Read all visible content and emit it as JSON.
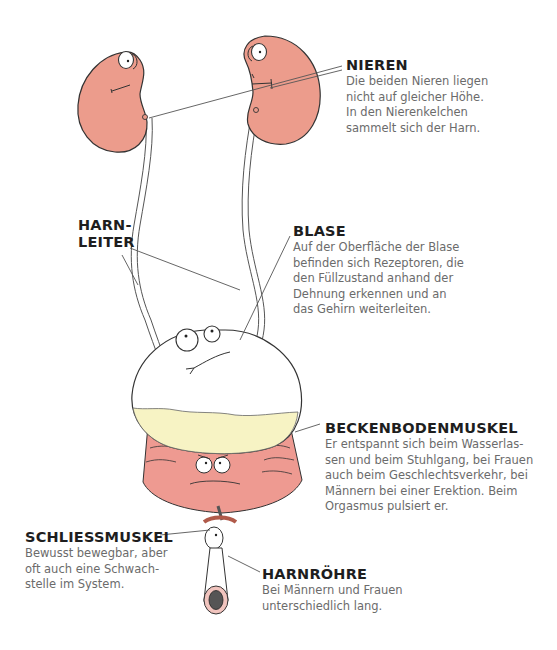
{
  "colors": {
    "kidney": "#ec9c8c",
    "bladder": "#ffffff",
    "urine": "#f7f3c4",
    "pelvic_muscle": "#ee9a91",
    "outline": "#333333",
    "title_text": "#1e1e1e",
    "body_text": "#6b6b6b"
  },
  "labels": {
    "nieren": {
      "title": "NIEREN",
      "lines": [
        "Die beiden Nieren liegen",
        "nicht auf gleicher Höhe.",
        "In den Nierenkelchen",
        "sammelt sich der Harn."
      ]
    },
    "harnleiter": {
      "title_lines": [
        "HARN-",
        "LEITER"
      ]
    },
    "blase": {
      "title": "BLASE",
      "lines": [
        "Auf der Oberfläche der Blase",
        "befinden sich Rezeptoren, die",
        "den Füllzustand anhand der",
        "Dehnung erkennen und an",
        "das Gehirn weiterleiten."
      ]
    },
    "beckenbodenmuskel": {
      "title": "BECKENBODENMUSKEL",
      "lines": [
        "Er entspannt sich beim Wasserlas-",
        "sen und beim Stuhlgang, bei Frauen",
        "auch beim Geschlechtsverkehr, bei",
        "Männern bei einer Erektion. Beim",
        "Orgasmus pulsiert er."
      ]
    },
    "schliessmuskel": {
      "title": "SCHLIESSMUSKEL",
      "lines": [
        "Bewusst bewegbar, aber",
        "oft auch eine Schwach-",
        "stelle im System."
      ]
    },
    "harnroehre": {
      "title": "HARNRÖHRE",
      "lines": [
        "Bei Männern und Frauen",
        "unterschiedlich lang."
      ]
    }
  }
}
